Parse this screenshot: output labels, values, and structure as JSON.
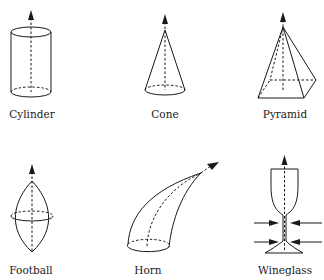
{
  "figure": {
    "shapes": [
      {
        "id": "cylinder",
        "label": "Cylinder"
      },
      {
        "id": "cone",
        "label": "Cone"
      },
      {
        "id": "pyramid",
        "label": "Pyramid"
      },
      {
        "id": "football",
        "label": "Football"
      },
      {
        "id": "horn",
        "label": "Horn"
      },
      {
        "id": "wineglass",
        "label": "Wineglass"
      }
    ],
    "colors": {
      "line": "#1a1a1a",
      "background": "#ffffff"
    }
  }
}
